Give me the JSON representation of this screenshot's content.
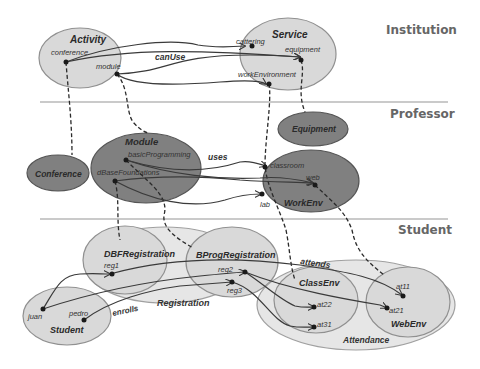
{
  "layers": [
    {
      "label": "Institution"
    },
    {
      "label": "Professor"
    },
    {
      "label": "Student"
    }
  ],
  "nodes": {
    "activity": {
      "title": "Activity",
      "items": [
        "conference",
        "module"
      ]
    },
    "service": {
      "title": "Service",
      "items": [
        "cattering",
        "equipment",
        "workEnvironment"
      ]
    },
    "equipment": {
      "title": "Equipment"
    },
    "conference": {
      "title": "Conference"
    },
    "module": {
      "title": "Module",
      "items": [
        "basicProgramming",
        "dBaseFoundations"
      ]
    },
    "workenv": {
      "title": "WorkEnv",
      "items": [
        "classroom",
        "web",
        "lab"
      ]
    },
    "registration": {
      "title": "Registration"
    },
    "dbfregistration": {
      "title": "DBFRegistration",
      "items": [
        "reg1"
      ]
    },
    "bprogregistration": {
      "title": "BProgRegistration",
      "items": [
        "reg2",
        "reg3"
      ]
    },
    "student": {
      "title": "Student",
      "items": [
        "juan",
        "pedro"
      ]
    },
    "attendance": {
      "title": "Attendance"
    },
    "classenv": {
      "title": "ClassEnv",
      "items": [
        "at22",
        "at31"
      ]
    },
    "webenv": {
      "title": "WebEnv",
      "items": [
        "at11",
        "at21"
      ]
    }
  },
  "edge_labels": {
    "canUse": "canUse",
    "uses": "uses",
    "enrolls": "enrolls",
    "attends": "attends"
  },
  "colors": {
    "light_fill": "#d9d9d9",
    "dark_fill": "#808080",
    "outer_fill": "#e6e6e6",
    "stroke": "#888888"
  }
}
